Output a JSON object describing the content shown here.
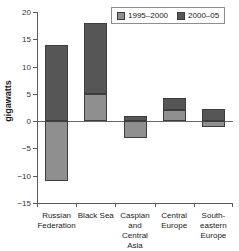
{
  "chart_data": {
    "type": "bar",
    "title": "",
    "subtitle": "",
    "xlabel": "",
    "ylabel": "gigawatts",
    "ylim": [
      -15,
      20
    ],
    "yticks": [
      20,
      15,
      10,
      5,
      0,
      -5,
      -10,
      -15
    ],
    "ytick_labels": [
      "20",
      "15",
      "10",
      "5",
      "0",
      "−5",
      "−10",
      "−15"
    ],
    "grid": false,
    "stacked": true,
    "legend_position": "top-right",
    "categories": [
      "Russian Federation",
      "Black Sea",
      "Caspian and Central Asia",
      "Central Europe",
      "South-eastern Europe"
    ],
    "category_lines": [
      [
        "Russian",
        "Federation"
      ],
      [
        "Black Sea"
      ],
      [
        "Caspian",
        "and Central",
        "Asia"
      ],
      [
        "Central",
        "Europe"
      ],
      [
        "South-",
        "eastern",
        "Europe"
      ]
    ],
    "series": [
      {
        "name": "1995–2000",
        "color": "#8f8f8f",
        "values": [
          -11,
          5,
          -3,
          2,
          -1
        ]
      },
      {
        "name": "2000–05",
        "color": "#565656",
        "values": [
          14,
          13,
          1,
          2.2,
          2.2
        ]
      }
    ],
    "bar_totals_positive": [
      14,
      18,
      1,
      4.2,
      2.2
    ],
    "bar_totals_negative": [
      -11,
      0,
      -3,
      0,
      -1
    ]
  },
  "legend": {
    "items": [
      {
        "label": "1995–2000",
        "color": "#8f8f8f"
      },
      {
        "label": "2000–05",
        "color": "#565656"
      }
    ]
  },
  "axis": {
    "y_title": "gigawatts"
  }
}
